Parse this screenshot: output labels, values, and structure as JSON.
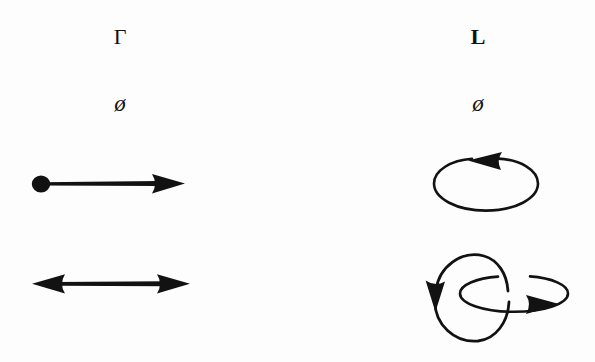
{
  "figure": {
    "background_color": "#fdfdfd",
    "ink_color": "#121212",
    "width": 595,
    "height": 362
  },
  "columns": [
    {
      "id": "gamma",
      "header": "Γ",
      "header_x": 120,
      "header_y": 26,
      "sub_label": "ø",
      "sub_label_x": 120,
      "sub_label_y": 92,
      "rows": [
        {
          "id": "gamma-row-1",
          "diagram": "dot-arrow-right",
          "x": 30,
          "y": 166,
          "width": 165,
          "height": 36
        },
        {
          "id": "gamma-row-2",
          "diagram": "double-headed-arrow",
          "x": 26,
          "y": 266,
          "width": 172,
          "height": 36
        }
      ]
    },
    {
      "id": "ell",
      "header": "L",
      "header_x": 478,
      "header_y": 26,
      "sub_label": "ø",
      "sub_label_x": 478,
      "sub_label_y": 92,
      "rows": [
        {
          "id": "ell-row-1",
          "diagram": "single-loop-ccw",
          "x": 428,
          "y": 150,
          "width": 118,
          "height": 70
        },
        {
          "id": "ell-row-2",
          "diagram": "interlocked-loops",
          "x": 418,
          "y": 240,
          "width": 158,
          "height": 108
        }
      ]
    }
  ]
}
